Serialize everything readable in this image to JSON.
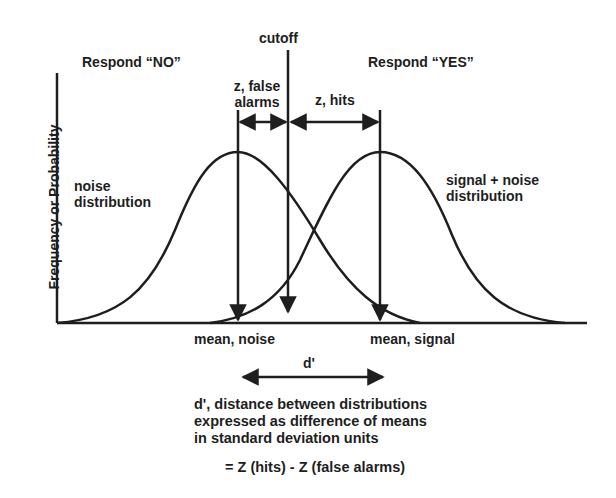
{
  "diagram": {
    "y_axis_label": "Frequency or Probability",
    "regions": {
      "left": "Respond “NO”",
      "right": "Respond “YES”"
    },
    "cutoff_label": "cutoff",
    "z_false_alarms_label": [
      "z, false",
      "alarms"
    ],
    "z_hits_label": "z, hits",
    "noise_label": [
      "noise",
      "distribution"
    ],
    "signal_label": [
      "signal + noise",
      "distribution"
    ],
    "mean_noise_label": "mean, noise",
    "mean_signal_label": "mean, signal",
    "dprime_label": "d'",
    "description": [
      "d',  distance between distributions",
      "expressed as difference of means",
      "in standard deviation units"
    ],
    "formula": "= Z (hits) - Z (false alarms)",
    "colors": {
      "ink": "#1e1e1e",
      "background": "#ffffff"
    }
  }
}
